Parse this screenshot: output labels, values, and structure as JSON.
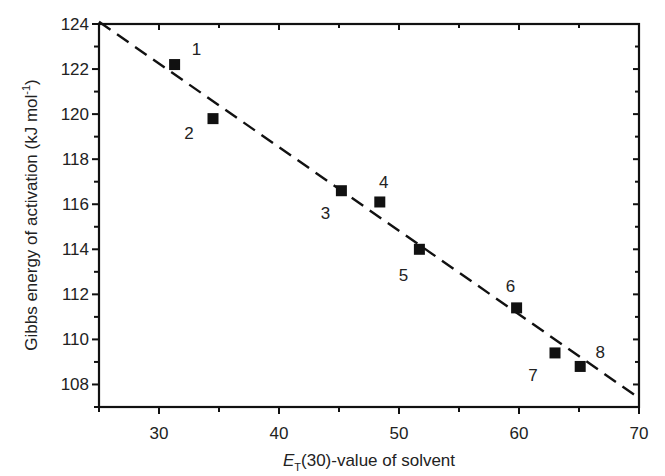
{
  "chart_data": {
    "type": "scatter",
    "title": "",
    "xlabel_main": "E",
    "xlabel_sub": "T",
    "xlabel_rest": "(30)-value of solvent",
    "ylabel": "Gibbs energy of activation (kJ mol",
    "ylabel_sup": "-1",
    "ylabel_end": ")",
    "xlim": [
      25,
      70
    ],
    "ylim": [
      107,
      124
    ],
    "x_ticks": [
      30,
      40,
      50,
      60,
      70
    ],
    "x_minor_ticks": [
      25,
      35,
      45,
      55,
      65
    ],
    "y_ticks": [
      108,
      110,
      112,
      114,
      116,
      118,
      120,
      122,
      124
    ],
    "y_minor_ticks": [
      107,
      109,
      111,
      113,
      115,
      117,
      119,
      121,
      123
    ],
    "grid": false,
    "legend": null,
    "series": [
      {
        "name": "solvents",
        "marker": "square",
        "points": [
          {
            "label": "1",
            "x": 31.3,
            "y": 122.2
          },
          {
            "label": "2",
            "x": 34.5,
            "y": 119.8
          },
          {
            "label": "3",
            "x": 45.2,
            "y": 116.6
          },
          {
            "label": "4",
            "x": 48.4,
            "y": 116.1
          },
          {
            "label": "5",
            "x": 51.7,
            "y": 114.0
          },
          {
            "label": "6",
            "x": 59.8,
            "y": 111.4
          },
          {
            "label": "7",
            "x": 63.0,
            "y": 109.4
          },
          {
            "label": "8",
            "x": 65.1,
            "y": 108.8
          }
        ]
      }
    ],
    "fit_line": {
      "style": "dashed",
      "x": [
        25,
        70
      ],
      "y": [
        124.1,
        107.4
      ]
    },
    "label_offsets": {
      "1": [
        22,
        -16
      ],
      "2": [
        -24,
        14
      ],
      "3": [
        -16,
        22
      ],
      "4": [
        4,
        -20
      ],
      "5": [
        -16,
        26
      ],
      "6": [
        -6,
        -22
      ],
      "7": [
        -22,
        22
      ],
      "8": [
        20,
        -14
      ]
    }
  }
}
